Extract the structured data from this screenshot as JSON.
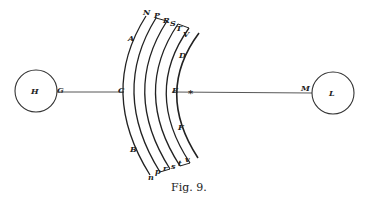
{
  "figure": {
    "caption": "Fig. 9.",
    "left_circle": {
      "label": "H",
      "tangent_label": "G"
    },
    "right_circle": {
      "label": "L",
      "tangent_label": "M"
    },
    "axis_labels": {
      "outer": "C",
      "inner": "E",
      "star": "*"
    },
    "arc_side_labels": {
      "upper_left": "A",
      "lower_left": "B",
      "upper_right": "D",
      "lower_right": "F"
    },
    "top_labels": [
      "N",
      "P",
      "R",
      "S",
      "T",
      "V"
    ],
    "bottom_labels": [
      "n",
      "p",
      "r",
      "s",
      "t",
      "v"
    ]
  }
}
